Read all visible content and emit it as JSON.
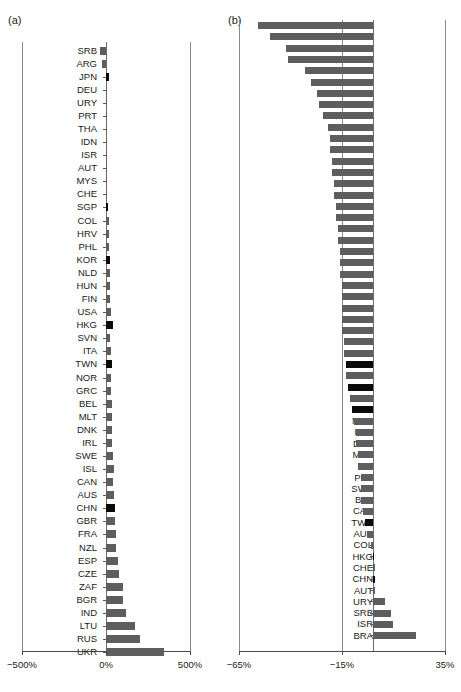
{
  "figure": {
    "panels": [
      {
        "tag": "(a)",
        "axis": {
          "ticks": [
            "-500%",
            "0%",
            "500%"
          ],
          "tick_values": [
            -500,
            0,
            500
          ],
          "xmin": -500,
          "xmax": 500,
          "zero": 0
        },
        "bar_color": "#5e5e5e",
        "highlight_color": "#0a0a0a"
      },
      {
        "tag": "(b)",
        "axis": {
          "ticks": [
            "-65%",
            "-15%",
            "35%"
          ],
          "tick_values": [
            -65,
            -15,
            35
          ],
          "xmin": -65,
          "xmax": 35,
          "zero": 0
        },
        "bar_color": "#5e5e5e",
        "highlight_color": "#0a0a0a"
      }
    ]
  },
  "chart_data": [
    {
      "type": "bar",
      "orientation": "horizontal",
      "title": "(a)",
      "xlabel": "",
      "ylabel": "",
      "xlim": [
        -500,
        500
      ],
      "xticks": [
        -500,
        0,
        500
      ],
      "xticklabels": [
        "-500%",
        "0%",
        "500%"
      ],
      "grid": false,
      "legend": "none",
      "categories": [
        "SRB",
        "ARG",
        "JPN",
        "DEU",
        "URY",
        "PRT",
        "THA",
        "IDN",
        "ISR",
        "AUT",
        "MYS",
        "CHE",
        "SGP",
        "COL",
        "HRV",
        "PHL",
        "KOR",
        "NLD",
        "HUN",
        "FIN",
        "USA",
        "HKG",
        "SVN",
        "ITA",
        "TWN",
        "NOR",
        "GRC",
        "BEL",
        "MLT",
        "DNK",
        "IRL",
        "SWE",
        "ISL",
        "CAN",
        "AUS",
        "CHN",
        "GBR",
        "FRA",
        "NZL",
        "ESP",
        "CZE",
        "ZAF",
        "BGR",
        "IND",
        "LTU",
        "RUS",
        "UKR"
      ],
      "values": [
        -36,
        -26,
        16,
        8,
        4,
        2,
        2,
        3,
        3,
        4,
        5,
        6,
        12,
        17,
        18,
        19,
        24,
        22,
        23,
        26,
        28,
        40,
        24,
        27,
        33,
        30,
        31,
        33,
        38,
        36,
        37,
        40,
        45,
        44,
        45,
        52,
        53,
        57,
        62,
        70,
        77,
        100,
        103,
        118,
        170,
        205,
        345
      ],
      "highlighted": [
        "JPN",
        "SGP",
        "KOR",
        "HKG",
        "TWN",
        "CHN"
      ]
    },
    {
      "type": "bar",
      "orientation": "horizontal",
      "title": "(b)",
      "xlabel": "",
      "ylabel": "",
      "xlim": [
        -65,
        35
      ],
      "xticks": [
        -65,
        -15,
        35
      ],
      "xticklabels": [
        "-65%",
        "-15%",
        "35%"
      ],
      "grid": false,
      "legend": "none",
      "categories": [
        "LVA",
        "UKR",
        "LTU",
        "EST",
        "ISL",
        "BGR",
        "TUR",
        "IRL",
        "THA",
        "HUN",
        "DNK",
        "IND",
        "SVK",
        "CZE",
        "POL",
        "USA",
        "SVN",
        "ESP",
        "GBR",
        "MLT",
        "GRC",
        "HRV",
        "NZL",
        "PHL",
        "ITA",
        "RUS",
        "CYP",
        "IDN",
        "FRA",
        "ZAF",
        "SGP",
        "NLD",
        "JPN",
        "ARG",
        "KOR",
        "NOR",
        "LUX",
        "DEU",
        "MYS",
        "FIN",
        "PRT",
        "SWE",
        "BEL",
        "CAN",
        "TWN",
        "AUS",
        "COL",
        "HKG",
        "CHE",
        "CHN",
        "AUT",
        "URY",
        "SRB",
        "ISR",
        "BRA"
      ],
      "values": [
        -56,
        -50,
        -42,
        -41,
        -33,
        -30,
        -27,
        -26,
        -24,
        -22,
        -21,
        -21,
        -20,
        -20,
        -19,
        -19,
        -18,
        -18,
        -17,
        -17,
        -16,
        -16,
        -16,
        -15,
        -15,
        -15,
        -15,
        -15,
        -14,
        -14,
        -13,
        -13,
        -12,
        -11,
        -10,
        -9,
        -8,
        -8,
        -7,
        -7,
        -6,
        -6,
        -6,
        -5,
        -4,
        -3,
        -1,
        0,
        1,
        1,
        1,
        6,
        9,
        10,
        21
      ],
      "highlighted": [
        "SGP",
        "JPN",
        "KOR",
        "TWN",
        "HKG",
        "CHN"
      ]
    }
  ]
}
